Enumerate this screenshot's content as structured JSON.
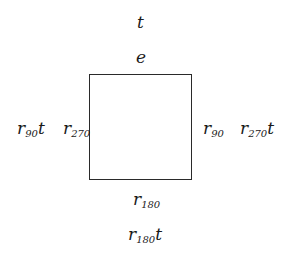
{
  "diagram": {
    "square": {
      "left": 89,
      "top": 74,
      "width": 103,
      "height": 106
    },
    "labels": {
      "top_outer": {
        "base": "t",
        "sub": "",
        "suffix": ""
      },
      "top_inner": {
        "base": "e",
        "sub": "",
        "suffix": ""
      },
      "left_outer": {
        "base": "r",
        "sub": "90",
        "suffix": "t"
      },
      "left_inner": {
        "base": "r",
        "sub": "270",
        "suffix": ""
      },
      "right_inner": {
        "base": "r",
        "sub": "90",
        "suffix": ""
      },
      "right_outer": {
        "base": "r",
        "sub": "270",
        "suffix": "t"
      },
      "bottom_inner": {
        "base": "r",
        "sub": "180",
        "suffix": ""
      },
      "bottom_outer": {
        "base": "r",
        "sub": "180",
        "suffix": "t"
      }
    }
  }
}
